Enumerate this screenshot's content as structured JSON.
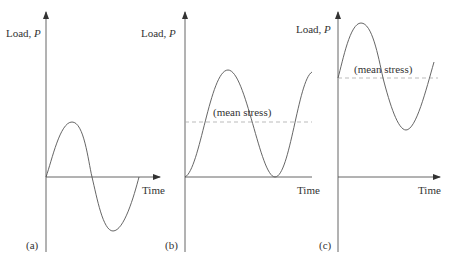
{
  "colors": {
    "line": "#555555",
    "dashed": "#aaaaaa",
    "text": "#333333"
  },
  "panels": [
    {
      "id": "a",
      "tag": "(a)",
      "y_label": "Load,",
      "y_symbol": "P",
      "x_label": "Time",
      "description": "Fully reversed cycle about zero load"
    },
    {
      "id": "b",
      "tag": "(b)",
      "y_label": "Load,",
      "y_symbol": "P",
      "x_label": "Time",
      "annotation": "(mean stress)",
      "description": "Repeated cycle from zero to maximum load"
    },
    {
      "id": "c",
      "tag": "(c)",
      "y_label": "Load,",
      "y_symbol": "P",
      "x_label": "Time",
      "annotation": "(mean stress)",
      "description": "Fluctuating cycle about a positive mean stress"
    }
  ]
}
